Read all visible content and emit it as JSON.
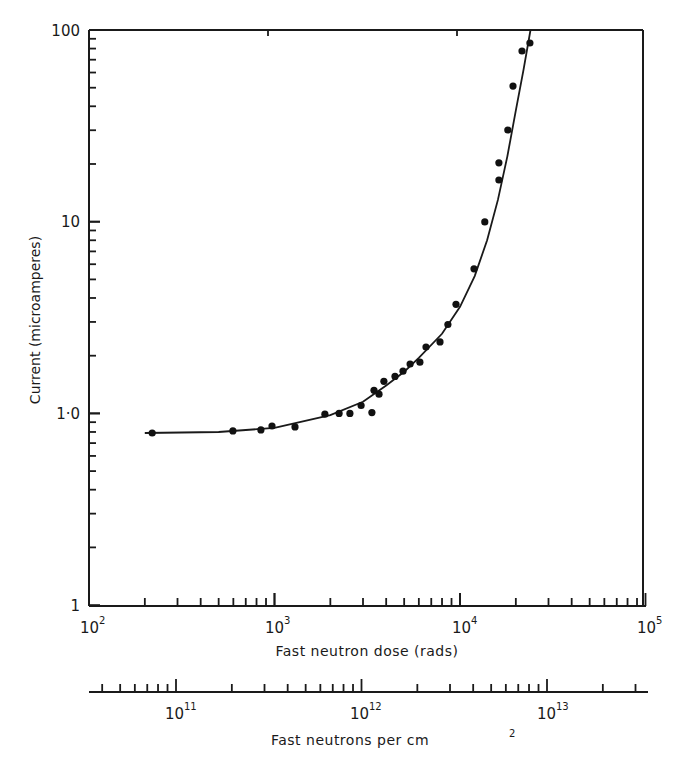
{
  "chart_data": {
    "type": "scatter",
    "title": "",
    "xlabel": "Fast neutron dose (rads)",
    "ylabel": "Current (microamperes)",
    "xscale": "log",
    "yscale": "log",
    "xlim": [
      100,
      100000
    ],
    "ylim": [
      0.1,
      100
    ],
    "x_tick_labels": [
      "10^2",
      "10^3",
      "10^4",
      "10^5"
    ],
    "y_tick_labels": [
      "1",
      "1·0",
      "10",
      "100"
    ],
    "grid": false,
    "legend": null,
    "secondary_xaxis": {
      "label": "Fast neutrons per cm²",
      "scale": "log",
      "tick_labels": [
        "10^11",
        "10^12",
        "10^13"
      ],
      "range_approx": [
        34000000000.0,
        30000000000000.0
      ]
    },
    "series": [
      {
        "name": "measured",
        "style": "points",
        "x": [
          219,
          597,
          845,
          970,
          1290,
          1870,
          2230,
          2550,
          2930,
          3350,
          3440,
          3660,
          3890,
          4460,
          4930,
          5380,
          6080,
          6560,
          7800,
          8610,
          9510,
          11900,
          13600,
          16200,
          16200,
          18100,
          19300,
          21600,
          23800
        ],
        "y": [
          0.79,
          0.81,
          0.82,
          0.86,
          0.85,
          0.99,
          1.0,
          1.0,
          1.1,
          1.01,
          1.32,
          1.26,
          1.47,
          1.56,
          1.66,
          1.81,
          1.85,
          2.22,
          2.36,
          2.91,
          3.71,
          5.68,
          9.98,
          16.5,
          20.3,
          30.1,
          51.0,
          77.7,
          85.5
        ]
      },
      {
        "name": "fitted curve",
        "style": "line",
        "x": [
          200,
          500,
          1000,
          2000,
          3000,
          4000,
          5000,
          6000,
          8000,
          10000,
          12000,
          14000,
          16000,
          18000,
          20000,
          22000,
          24000
        ],
        "y": [
          0.79,
          0.8,
          0.84,
          0.98,
          1.15,
          1.4,
          1.65,
          1.95,
          2.6,
          3.6,
          5.2,
          8.0,
          13.0,
          22.0,
          38.0,
          62.0,
          100.0
        ]
      }
    ]
  },
  "labels": {
    "y_100": "100",
    "y_10": "10",
    "y_1_0": "1·0",
    "y_1": "1",
    "x_base": "10",
    "x_exp_2": "2",
    "x_exp_3": "3",
    "x_exp_4": "4",
    "x_exp_5": "5",
    "x2_exp_11": "11",
    "x2_exp_12": "12",
    "x2_exp_13": "13",
    "xlabel": "Fast neutron dose (rads)",
    "ylabel": "Current (microamperes)",
    "x2label_main": "Fast neutrons per cm",
    "x2label_sup": "2"
  }
}
